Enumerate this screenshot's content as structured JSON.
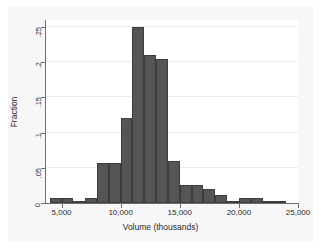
{
  "chart_data": {
    "type": "bar",
    "title": "",
    "subtitle": "",
    "xlabel": "Volume (thousands)",
    "ylabel": "Fraction",
    "xlim": [
      3600,
      25000
    ],
    "ylim": [
      0,
      0.26
    ],
    "grid": true,
    "legend": null,
    "bin_width": 1000,
    "x_ticks": [
      {
        "value": 5000,
        "label": "5,000"
      },
      {
        "value": 10000,
        "label": "10,000"
      },
      {
        "value": 15000,
        "label": "15,000"
      },
      {
        "value": 20000,
        "label": "20,000"
      },
      {
        "value": 25000,
        "label": "25,000"
      }
    ],
    "y_ticks": [
      {
        "value": 0,
        "label": "0"
      },
      {
        "value": 0.05,
        "label": ".05"
      },
      {
        "value": 0.1,
        "label": ".1"
      },
      {
        "value": 0.15,
        "label": ".15"
      },
      {
        "value": 0.2,
        "label": ".2"
      },
      {
        "value": 0.25,
        "label": ".25"
      }
    ],
    "bins": [
      {
        "x0": 4000,
        "x1": 5000,
        "value": 0.007
      },
      {
        "x0": 5000,
        "x1": 6000,
        "value": 0.007
      },
      {
        "x0": 6000,
        "x1": 7000,
        "value": 0.003
      },
      {
        "x0": 7000,
        "x1": 8000,
        "value": 0.007
      },
      {
        "x0": 8000,
        "x1": 9000,
        "value": 0.057
      },
      {
        "x0": 9000,
        "x1": 10000,
        "value": 0.057
      },
      {
        "x0": 10000,
        "x1": 11000,
        "value": 0.121
      },
      {
        "x0": 11000,
        "x1": 12000,
        "value": 0.25
      },
      {
        "x0": 12000,
        "x1": 13000,
        "value": 0.21
      },
      {
        "x0": 13000,
        "x1": 14000,
        "value": 0.205
      },
      {
        "x0": 14000,
        "x1": 15000,
        "value": 0.06
      },
      {
        "x0": 15000,
        "x1": 16000,
        "value": 0.025
      },
      {
        "x0": 16000,
        "x1": 17000,
        "value": 0.025
      },
      {
        "x0": 17000,
        "x1": 18000,
        "value": 0.02
      },
      {
        "x0": 18000,
        "x1": 19000,
        "value": 0.011
      },
      {
        "x0": 19000,
        "x1": 20000,
        "value": 0.003
      },
      {
        "x0": 20000,
        "x1": 21000,
        "value": 0.007
      },
      {
        "x0": 21000,
        "x1": 22000,
        "value": 0.007
      },
      {
        "x0": 22000,
        "x1": 23000,
        "value": 0.003
      },
      {
        "x0": 23000,
        "x1": 24000,
        "value": 0.003
      }
    ],
    "colors": {
      "bar_fill": "#555555",
      "bar_edge": "#3d3d3d",
      "gridline": "#ebebeb",
      "axis": "#6e6e6e",
      "plot_background": "#ffffff",
      "graph_background": "#f7f7f7",
      "text": "#2b2b2b"
    }
  }
}
